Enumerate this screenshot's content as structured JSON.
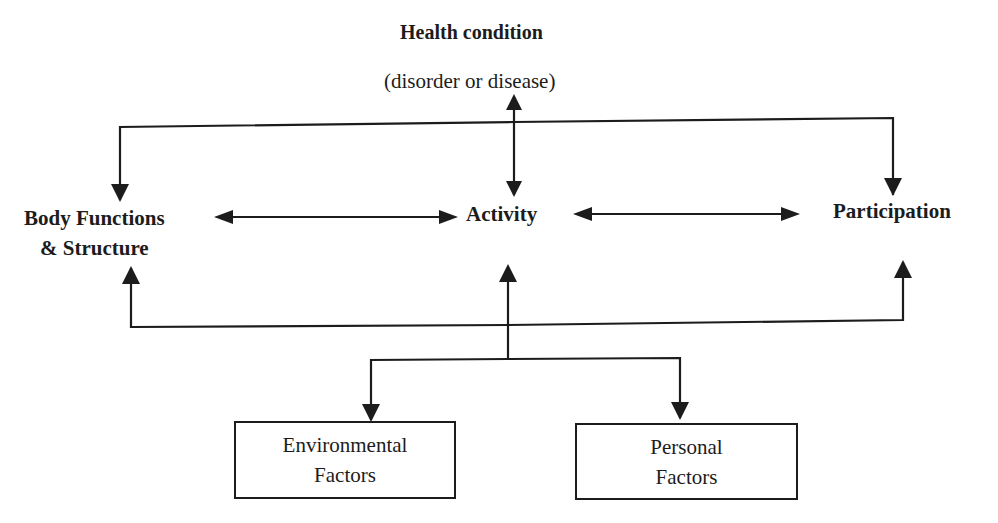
{
  "diagram": {
    "title": "Health condition",
    "subtitle": "(disorder or disease)",
    "nodes": {
      "body_functions": {
        "line1": "Body Functions",
        "line2": "& Structure"
      },
      "activity": {
        "label": "Activity"
      },
      "participation": {
        "label": "Participation"
      },
      "environmental_factors": {
        "line1": "Environmental",
        "line2": "Factors"
      },
      "personal_factors": {
        "line1": "Personal",
        "line2": "Factors"
      }
    },
    "edges": [
      {
        "from": "health_condition",
        "to": "activity",
        "type": "bidirectional"
      },
      {
        "from": "health_condition",
        "to": "body_functions",
        "type": "directed"
      },
      {
        "from": "health_condition",
        "to": "participation",
        "type": "directed"
      },
      {
        "from": "body_functions",
        "to": "activity",
        "type": "bidirectional"
      },
      {
        "from": "activity",
        "to": "participation",
        "type": "bidirectional"
      },
      {
        "from": "contextual_factors",
        "to": "activity",
        "type": "directed"
      },
      {
        "from": "contextual_factors",
        "to": "body_functions",
        "type": "directed"
      },
      {
        "from": "contextual_factors",
        "to": "participation",
        "type": "directed"
      },
      {
        "from": "contextual_factors",
        "to": "environmental_factors",
        "type": "directed"
      },
      {
        "from": "contextual_factors",
        "to": "personal_factors",
        "type": "directed"
      }
    ],
    "colors": {
      "ink": "#1c1c1c",
      "background": "#ffffff"
    }
  }
}
